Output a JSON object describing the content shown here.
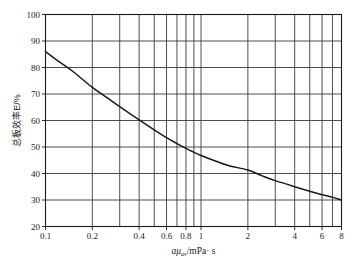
{
  "chart_data": {
    "type": "line",
    "title": "",
    "xlabel": "aμ_av/mPa·s",
    "xlabel_parts": {
      "var": "a",
      "mu": "μ",
      "sub": "av",
      "unit": "/mPa· s"
    },
    "ylabel": "总板效率E/%",
    "xscale": "log",
    "yscale": "linear",
    "xlim": [
      0.1,
      8
    ],
    "ylim": [
      20,
      100
    ],
    "grid": true,
    "legend": "none",
    "xticks": [
      0.1,
      0.2,
      0.4,
      0.6,
      0.8,
      1,
      2,
      4,
      6,
      8
    ],
    "xticklabels": [
      "0.1",
      "0.2",
      "0.4",
      "0.6",
      "0.8",
      "1",
      "2",
      "4",
      "6",
      "8"
    ],
    "xgridlines": [
      0.1,
      0.2,
      0.3,
      0.4,
      0.5,
      0.6,
      0.7,
      0.8,
      0.9,
      1,
      2,
      3,
      4,
      5,
      6,
      7,
      8
    ],
    "yticks": [
      20,
      30,
      40,
      50,
      60,
      70,
      80,
      90,
      100
    ],
    "yticklabels": [
      "20",
      "30",
      "40",
      "50",
      "60",
      "70",
      "80",
      "90",
      "100"
    ],
    "ygridlines": [
      30,
      40,
      50,
      60,
      70,
      80,
      90
    ],
    "series": [
      {
        "name": "总板效率",
        "color": "#1a1a1a",
        "x": [
          0.1,
          0.12,
          0.15,
          0.2,
          0.25,
          0.3,
          0.4,
          0.5,
          0.6,
          0.7,
          0.8,
          0.9,
          1.0,
          1.2,
          1.5,
          2.0,
          2.5,
          3.0,
          4.0,
          5.0,
          6.0,
          7.0,
          8.0
        ],
        "y": [
          86.0,
          82.5,
          78.5,
          72.5,
          68.5,
          65.2,
          60.2,
          56.5,
          53.5,
          51.3,
          49.5,
          48.0,
          46.8,
          45.0,
          43.0,
          41.3,
          39.0,
          37.3,
          35.0,
          33.3,
          32.0,
          31.0,
          30.0
        ]
      }
    ]
  }
}
